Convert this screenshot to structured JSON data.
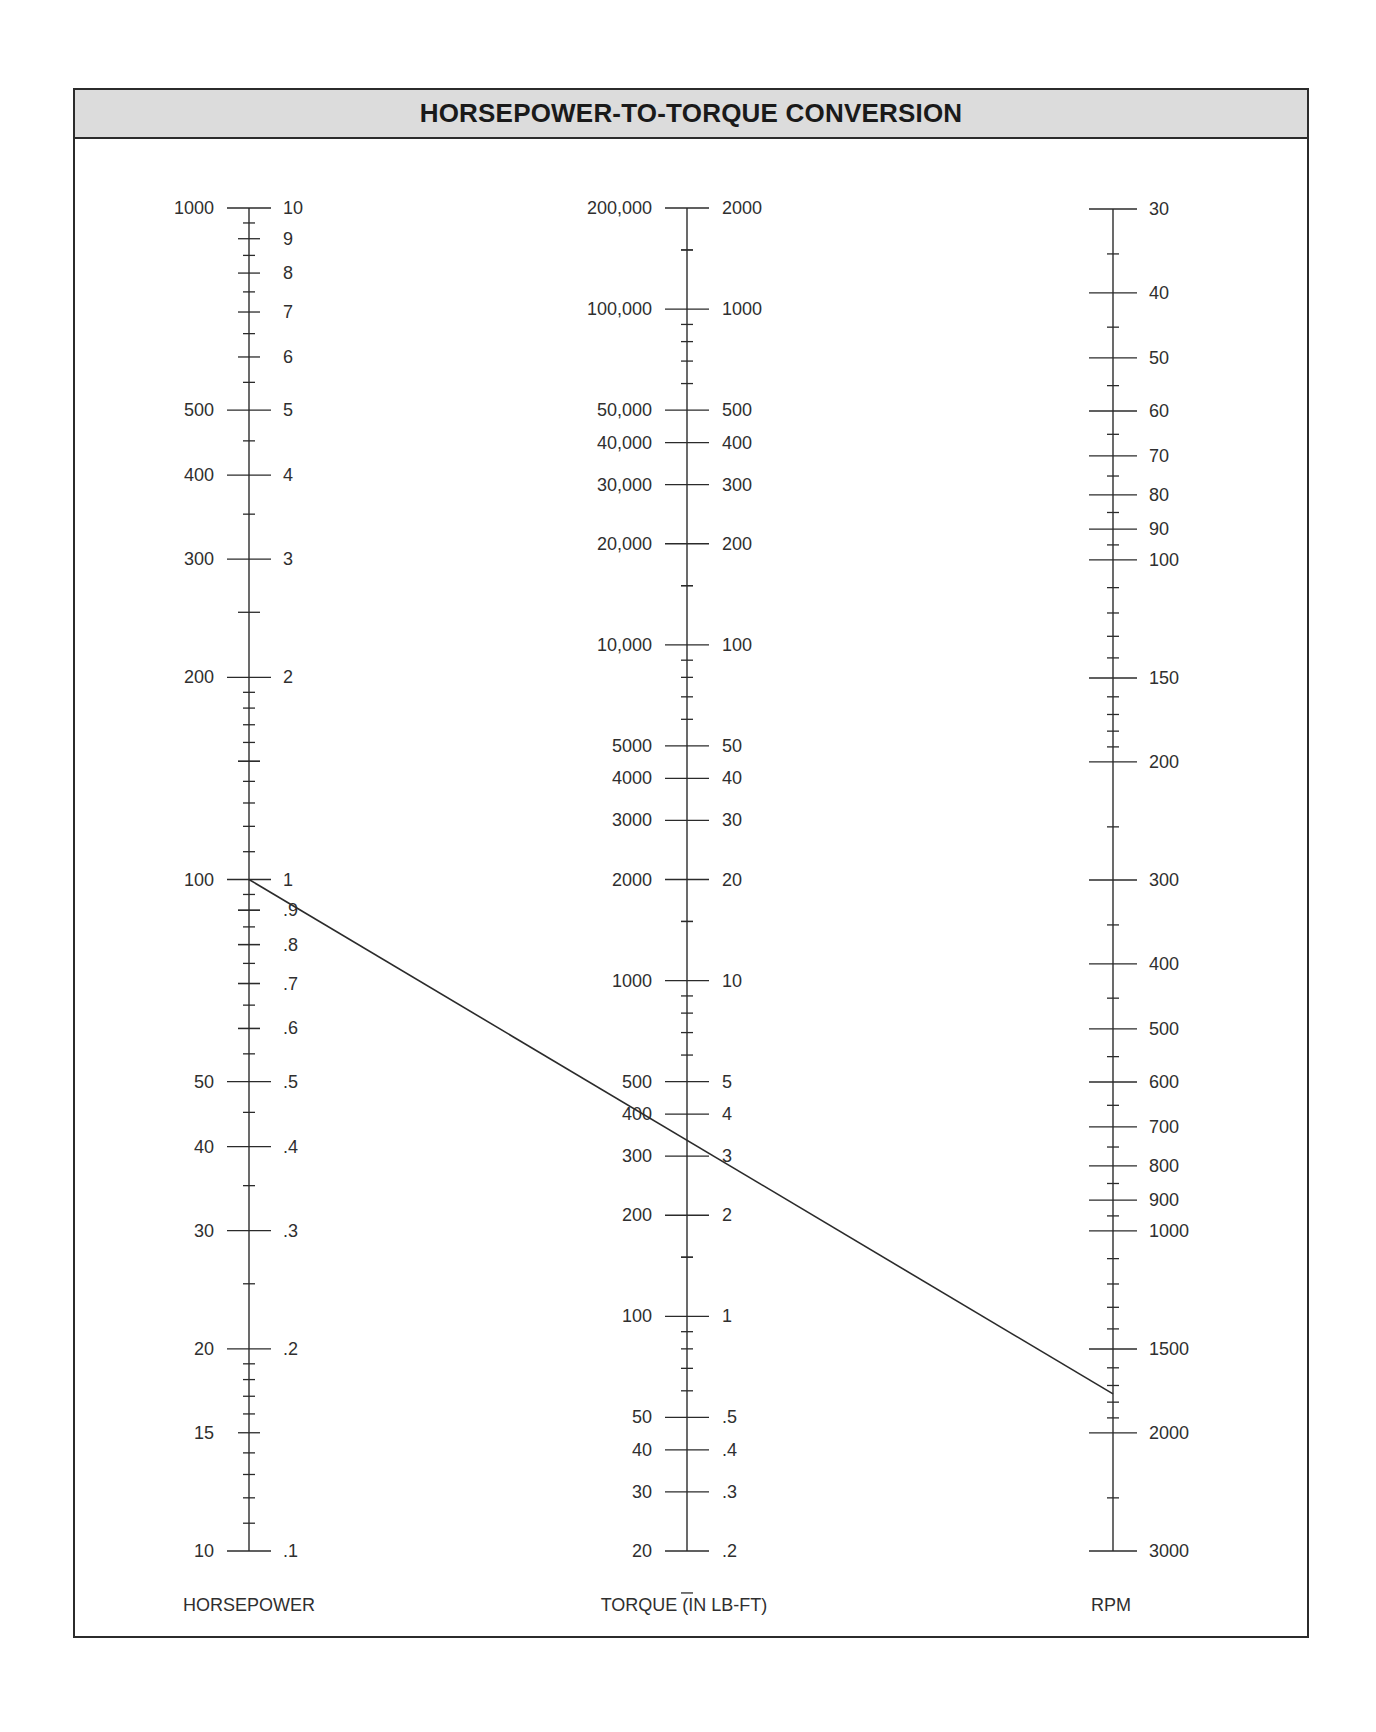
{
  "header": {
    "title": "HORSEPOWER-TO-TORQUE CONVERSION"
  },
  "axes": {
    "horsepower": {
      "title": "HORSEPOWER",
      "left_labels": [
        {
          "text": "1000",
          "value": 1000
        },
        {
          "text": "500",
          "value": 500
        },
        {
          "text": "400",
          "value": 400
        },
        {
          "text": "300",
          "value": 300
        },
        {
          "text": "200",
          "value": 200
        },
        {
          "text": "100",
          "value": 100
        },
        {
          "text": "50",
          "value": 50
        },
        {
          "text": "40",
          "value": 40
        },
        {
          "text": "30",
          "value": 30
        },
        {
          "text": "20",
          "value": 20
        },
        {
          "text": "15",
          "value": 15
        },
        {
          "text": "10",
          "value": 10
        }
      ],
      "right_labels": [
        {
          "text": "10",
          "value": 1000
        },
        {
          "text": "9",
          "value": 900
        },
        {
          "text": "8",
          "value": 800
        },
        {
          "text": "7",
          "value": 700
        },
        {
          "text": "6",
          "value": 600
        },
        {
          "text": "5",
          "value": 500
        },
        {
          "text": "4",
          "value": 400
        },
        {
          "text": "3",
          "value": 300
        },
        {
          "text": "2",
          "value": 200
        },
        {
          "text": "1",
          "value": 100
        },
        {
          "text": ".9",
          "value": 90
        },
        {
          "text": ".8",
          "value": 80
        },
        {
          "text": ".7",
          "value": 70
        },
        {
          "text": ".6",
          "value": 60
        },
        {
          "text": ".5",
          "value": 50
        },
        {
          "text": ".4",
          "value": 40
        },
        {
          "text": ".3",
          "value": 30
        },
        {
          "text": ".2",
          "value": 20
        },
        {
          "text": ".1",
          "value": 10
        }
      ]
    },
    "torque": {
      "title": "TORQUE (IN LB-FT)",
      "left_labels": [
        {
          "text": "200,000",
          "value": 200000
        },
        {
          "text": "100,000",
          "value": 100000
        },
        {
          "text": "50,000",
          "value": 50000
        },
        {
          "text": "40,000",
          "value": 40000
        },
        {
          "text": "30,000",
          "value": 30000
        },
        {
          "text": "20,000",
          "value": 20000
        },
        {
          "text": "10,000",
          "value": 10000
        },
        {
          "text": "5000",
          "value": 5000
        },
        {
          "text": "4000",
          "value": 4000
        },
        {
          "text": "3000",
          "value": 3000
        },
        {
          "text": "2000",
          "value": 2000
        },
        {
          "text": "1000",
          "value": 1000
        },
        {
          "text": "500",
          "value": 500
        },
        {
          "text": "400",
          "value": 400
        },
        {
          "text": "300",
          "value": 300
        },
        {
          "text": "200",
          "value": 200
        },
        {
          "text": "100",
          "value": 100
        },
        {
          "text": "50",
          "value": 50
        },
        {
          "text": "40",
          "value": 40
        },
        {
          "text": "30",
          "value": 30
        },
        {
          "text": "20",
          "value": 20
        }
      ],
      "right_labels": [
        {
          "text": "2000",
          "value": 200000
        },
        {
          "text": "1000",
          "value": 100000
        },
        {
          "text": "500",
          "value": 50000
        },
        {
          "text": "400",
          "value": 40000
        },
        {
          "text": "300",
          "value": 30000
        },
        {
          "text": "200",
          "value": 20000
        },
        {
          "text": "100",
          "value": 10000
        },
        {
          "text": "50",
          "value": 5000
        },
        {
          "text": "40",
          "value": 4000
        },
        {
          "text": "30",
          "value": 3000
        },
        {
          "text": "20",
          "value": 2000
        },
        {
          "text": "10",
          "value": 1000
        },
        {
          "text": "5",
          "value": 500
        },
        {
          "text": "4",
          "value": 400
        },
        {
          "text": "3",
          "value": 300
        },
        {
          "text": "2",
          "value": 200
        },
        {
          "text": "1",
          "value": 100
        },
        {
          "text": ".5",
          "value": 50
        },
        {
          "text": ".4",
          "value": 40
        },
        {
          "text": ".3",
          "value": 30
        },
        {
          "text": ".2",
          "value": 20
        }
      ]
    },
    "rpm": {
      "title": "RPM",
      "labels": [
        {
          "text": "30",
          "value": 30
        },
        {
          "text": "40",
          "value": 40
        },
        {
          "text": "50",
          "value": 50
        },
        {
          "text": "60",
          "value": 60
        },
        {
          "text": "70",
          "value": 70
        },
        {
          "text": "80",
          "value": 80
        },
        {
          "text": "90",
          "value": 90
        },
        {
          "text": "100",
          "value": 100
        },
        {
          "text": "150",
          "value": 150
        },
        {
          "text": "200",
          "value": 200
        },
        {
          "text": "300",
          "value": 300
        },
        {
          "text": "400",
          "value": 400
        },
        {
          "text": "500",
          "value": 500
        },
        {
          "text": "600",
          "value": 600
        },
        {
          "text": "700",
          "value": 700
        },
        {
          "text": "800",
          "value": 800
        },
        {
          "text": "900",
          "value": 900
        },
        {
          "text": "1000",
          "value": 1000
        },
        {
          "text": "1500",
          "value": 1500
        },
        {
          "text": "2000",
          "value": 2000
        },
        {
          "text": "3000",
          "value": 3000
        }
      ]
    }
  },
  "example_line": {
    "horsepower": 100,
    "torque": 300,
    "rpm": 1750
  },
  "colors": {
    "ink": "#2b2b2b",
    "header_bg": "#dcdcdc",
    "text": "#2f2f2f"
  }
}
